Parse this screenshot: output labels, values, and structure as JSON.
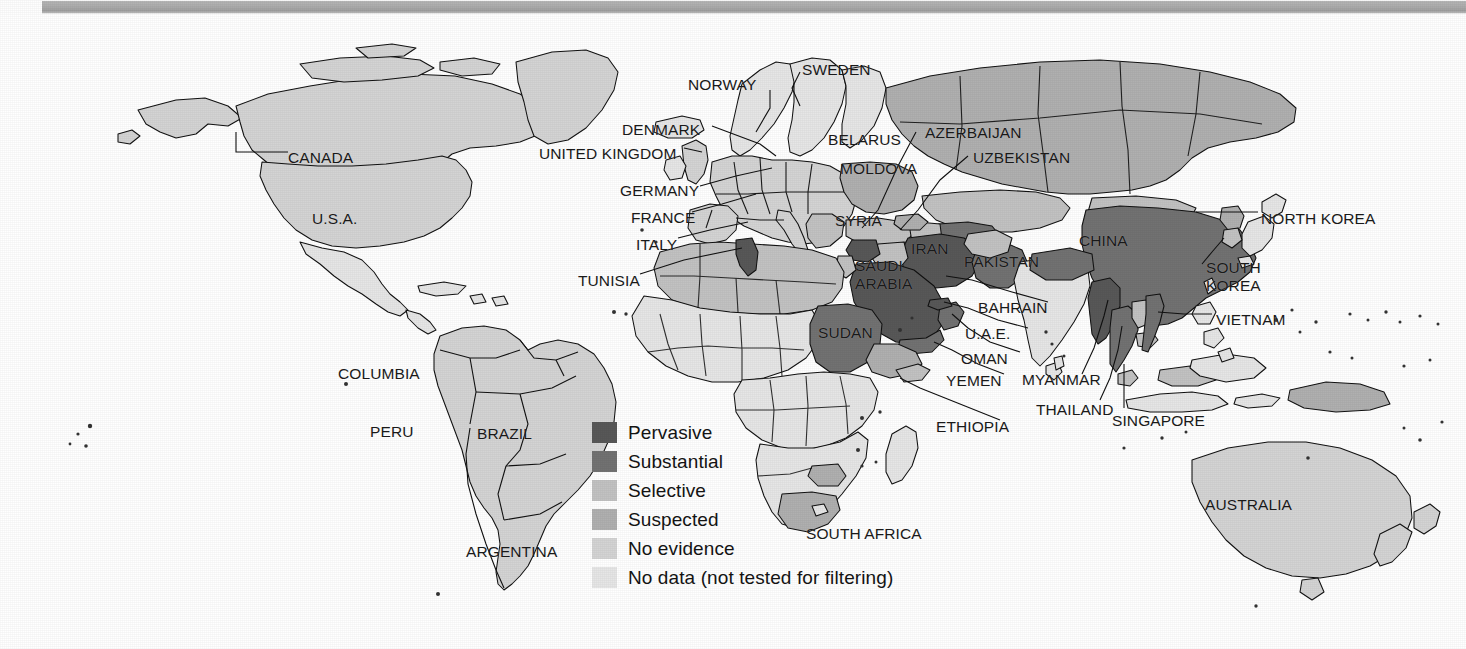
{
  "page": {
    "width": 1466,
    "height": 649,
    "background": "#ffffff",
    "scan_bar_color": "#aaaaaa"
  },
  "map": {
    "name": "world-internet-filtering-map",
    "outline_color": "#000000",
    "ocean_color": "#ffffff"
  },
  "legend": {
    "name": "filtering-level-legend",
    "items": [
      {
        "label": "Pervasive",
        "color": "#585858"
      },
      {
        "label": "Substantial",
        "color": "#727272"
      },
      {
        "label": "Selective",
        "color": "#c2c2c2"
      },
      {
        "label": "Suspected",
        "color": "#b0b0b0"
      },
      {
        "label": "No evidence",
        "color": "#d4d4d4"
      },
      {
        "label": "No data (not tested for filtering)",
        "color": "#e6e6e6"
      }
    ]
  },
  "labels": [
    {
      "text": "CANADA",
      "x": 288,
      "y": 135,
      "align": "left"
    },
    {
      "text": "U.S.A.",
      "x": 312,
      "y": 196,
      "align": "left"
    },
    {
      "text": "COLUMBIA",
      "x": 338,
      "y": 351,
      "align": "left"
    },
    {
      "text": "PERU",
      "x": 370,
      "y": 409,
      "align": "left"
    },
    {
      "text": "BRAZIL",
      "x": 477,
      "y": 411,
      "align": "left"
    },
    {
      "text": "ARGENTINA",
      "x": 466,
      "y": 529,
      "align": "left"
    },
    {
      "text": "NORWAY",
      "x": 688,
      "y": 62,
      "align": "left"
    },
    {
      "text": "SWEDEN",
      "x": 802,
      "y": 47,
      "align": "left"
    },
    {
      "text": "DENMARK",
      "x": 622,
      "y": 107,
      "align": "left"
    },
    {
      "text": "UNITED KINGDOM",
      "x": 539,
      "y": 131,
      "align": "left"
    },
    {
      "text": "GERMANY",
      "x": 620,
      "y": 168,
      "align": "left"
    },
    {
      "text": "FRANCE",
      "x": 631,
      "y": 195,
      "align": "left"
    },
    {
      "text": "ITALY",
      "x": 636,
      "y": 222,
      "align": "left"
    },
    {
      "text": "TUNISIA",
      "x": 578,
      "y": 258,
      "align": "left"
    },
    {
      "text": "BELARUS",
      "x": 828,
      "y": 117,
      "align": "left"
    },
    {
      "text": "MOLDOVA",
      "x": 840,
      "y": 146,
      "align": "left"
    },
    {
      "text": "AZERBAIJAN",
      "x": 925,
      "y": 110,
      "align": "left"
    },
    {
      "text": "UZBEKISTAN",
      "x": 973,
      "y": 135,
      "align": "left"
    },
    {
      "text": "SYRIA",
      "x": 835,
      "y": 198,
      "align": "left"
    },
    {
      "text": "IRAN",
      "x": 911,
      "y": 226,
      "align": "left"
    },
    {
      "text": "PAKISTAN",
      "x": 964,
      "y": 239,
      "align": "left"
    },
    {
      "text": "CHINA",
      "x": 1079,
      "y": 218,
      "align": "left"
    },
    {
      "text": "SAUDI\nARABIA",
      "x": 855,
      "y": 243,
      "align": "left"
    },
    {
      "text": "BAHRAIN",
      "x": 978,
      "y": 285,
      "align": "left"
    },
    {
      "text": "U.A.E.",
      "x": 965,
      "y": 311,
      "align": "left"
    },
    {
      "text": "OMAN",
      "x": 961,
      "y": 336,
      "align": "left"
    },
    {
      "text": "YEMEN",
      "x": 946,
      "y": 358,
      "align": "left"
    },
    {
      "text": "ETHIOPIA",
      "x": 936,
      "y": 404,
      "align": "left"
    },
    {
      "text": "SUDAN",
      "x": 818,
      "y": 310,
      "align": "left"
    },
    {
      "text": "SOUTH AFRICA",
      "x": 806,
      "y": 511,
      "align": "left"
    },
    {
      "text": "NORTH KOREA",
      "x": 1261,
      "y": 196,
      "align": "left"
    },
    {
      "text": "SOUTH\nKOREA",
      "x": 1206,
      "y": 245,
      "align": "left"
    },
    {
      "text": "VIETNAM",
      "x": 1216,
      "y": 297,
      "align": "left"
    },
    {
      "text": "MYANMAR",
      "x": 1022,
      "y": 357,
      "align": "left"
    },
    {
      "text": "THAILAND",
      "x": 1036,
      "y": 387,
      "align": "left"
    },
    {
      "text": "SINGAPORE",
      "x": 1112,
      "y": 398,
      "align": "left"
    },
    {
      "text": "AUSTRALIA",
      "x": 1205,
      "y": 482,
      "align": "left"
    }
  ],
  "chart_data": {
    "type": "map",
    "legend_title": "",
    "categories": [
      "Pervasive",
      "Substantial",
      "Selective",
      "Suspected",
      "No evidence",
      "No data (not tested for filtering)"
    ],
    "country_levels": [
      {
        "country": "CANADA",
        "level": "No evidence"
      },
      {
        "country": "U.S.A.",
        "level": "No evidence"
      },
      {
        "country": "COLUMBIA",
        "level": "No evidence"
      },
      {
        "country": "PERU",
        "level": "No evidence"
      },
      {
        "country": "BRAZIL",
        "level": "No evidence"
      },
      {
        "country": "ARGENTINA",
        "level": "No evidence"
      },
      {
        "country": "NORWAY",
        "level": "No evidence"
      },
      {
        "country": "SWEDEN",
        "level": "No evidence"
      },
      {
        "country": "DENMARK",
        "level": "Selective"
      },
      {
        "country": "UNITED KINGDOM",
        "level": "Selective"
      },
      {
        "country": "GERMANY",
        "level": "Selective"
      },
      {
        "country": "FRANCE",
        "level": "Selective"
      },
      {
        "country": "ITALY",
        "level": "Selective"
      },
      {
        "country": "TUNISIA",
        "level": "Pervasive"
      },
      {
        "country": "BELARUS",
        "level": "Suspected"
      },
      {
        "country": "MOLDOVA",
        "level": "Suspected"
      },
      {
        "country": "AZERBAIJAN",
        "level": "Suspected"
      },
      {
        "country": "UZBEKISTAN",
        "level": "Substantial"
      },
      {
        "country": "SYRIA",
        "level": "Pervasive"
      },
      {
        "country": "IRAN",
        "level": "Pervasive"
      },
      {
        "country": "PAKISTAN",
        "level": "Substantial"
      },
      {
        "country": "CHINA",
        "level": "Pervasive"
      },
      {
        "country": "SAUDI ARABIA",
        "level": "Pervasive"
      },
      {
        "country": "BAHRAIN",
        "level": "Substantial"
      },
      {
        "country": "U.A.E.",
        "level": "Pervasive"
      },
      {
        "country": "OMAN",
        "level": "Substantial"
      },
      {
        "country": "YEMEN",
        "level": "Substantial"
      },
      {
        "country": "ETHIOPIA",
        "level": "Suspected"
      },
      {
        "country": "SUDAN",
        "level": "Substantial"
      },
      {
        "country": "SOUTH AFRICA",
        "level": "Suspected"
      },
      {
        "country": "NORTH KOREA",
        "level": "Suspected"
      },
      {
        "country": "SOUTH KOREA",
        "level": "Selective"
      },
      {
        "country": "VIETNAM",
        "level": "Substantial"
      },
      {
        "country": "MYANMAR",
        "level": "Pervasive"
      },
      {
        "country": "THAILAND",
        "level": "Substantial"
      },
      {
        "country": "SINGAPORE",
        "level": "Selective"
      },
      {
        "country": "AUSTRALIA",
        "level": "No evidence"
      },
      {
        "country": "RUSSIA",
        "level": "Suspected"
      },
      {
        "country": "INDIA",
        "level": "Selective"
      }
    ]
  }
}
